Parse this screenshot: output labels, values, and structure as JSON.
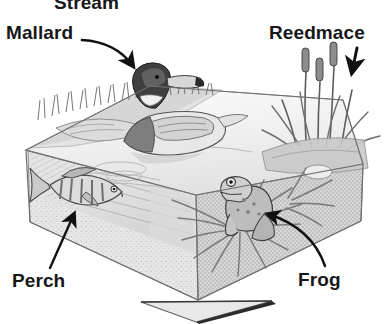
{
  "figure": {
    "type": "labelled-illustration",
    "style": "grayscale pencil / stipple shaded block diagram",
    "background_color": "#ffffff",
    "ink_color": "#17171a",
    "width_px": 388,
    "height_px": 324
  },
  "labels": [
    {
      "id": "stream",
      "text": "Stream",
      "position": "top-center",
      "clipped_at_top": true,
      "connector": "none-visible",
      "points_to": "stream inlet at back of pond"
    },
    {
      "id": "mallard",
      "text": "Mallard",
      "position": "top-left",
      "connector": "curved-arrow",
      "connector_direction": "down-right",
      "points_to": "duck floating on water surface"
    },
    {
      "id": "reedmace",
      "text": "Reedmace",
      "position": "top-right",
      "connector": "straight-arrow",
      "connector_direction": "down",
      "points_to": "reedmace bulrush stems on right bank"
    },
    {
      "id": "perch",
      "text": "Perch",
      "position": "bottom-left",
      "connector": "curved-arrow",
      "connector_direction": "up-right",
      "points_to": "fish in cutaway underwater section"
    },
    {
      "id": "frog",
      "text": "Frog",
      "position": "bottom-right",
      "connector": "curved-arrow",
      "connector_direction": "up-left",
      "points_to": "frog sitting among pond-side vegetation"
    }
  ],
  "scene_elements": [
    {
      "id": "pond-block",
      "name": "Pond block cutaway",
      "fill": "#e9e9e9"
    },
    {
      "id": "water-surface",
      "name": "Water surface",
      "fill": "#f2f2f2"
    },
    {
      "id": "soil-front-face",
      "name": "Front soil face (stippled)",
      "fill": "#cfcfcf"
    },
    {
      "id": "soil-left-face",
      "name": "Left soil face",
      "fill": "#dedede"
    },
    {
      "id": "grass-bank",
      "name": "Grass / reed bank (rear left)",
      "fill": "#b5b5b5"
    },
    {
      "id": "mallard-duck",
      "name": "Mallard duck",
      "fill": "#8a8a8a"
    },
    {
      "id": "perch-fish",
      "name": "Perch fish",
      "fill": "#9a9a9a"
    },
    {
      "id": "frog",
      "name": "Frog",
      "fill": "#909090"
    },
    {
      "id": "reedmace-plants",
      "name": "Reedmace bulrushes",
      "fill": "#777777"
    },
    {
      "id": "pond-weed",
      "name": "Submerged / emergent pond weed",
      "fill": "#8f8f8f"
    },
    {
      "id": "base-plinth",
      "name": "Light triangular base plate below block",
      "fill": "#e4e4e4"
    }
  ]
}
